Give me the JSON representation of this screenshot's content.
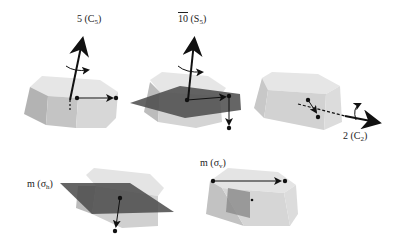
{
  "figure": {
    "panels": [
      {
        "id": "c5",
        "operation": "5",
        "symbol": "C",
        "subscript": "5",
        "type": "rotation-axis"
      },
      {
        "id": "s5",
        "operation": "10",
        "operation_overline": true,
        "symbol": "S",
        "subscript": "5",
        "type": "improper-rotation-axis"
      },
      {
        "id": "c2",
        "operation": "2",
        "symbol": "C",
        "subscript": "2",
        "type": "rotation-axis"
      },
      {
        "id": "sigma_h",
        "operation": "m",
        "symbol": "σ",
        "subscript": "h",
        "type": "mirror-plane"
      },
      {
        "id": "sigma_v",
        "operation": "m",
        "symbol": "σ",
        "subscript": "v",
        "type": "mirror-plane"
      }
    ],
    "colors": {
      "prism_light": "#e6e6e6",
      "prism_mid": "#c4c4c4",
      "prism_dark": "#a9a9a9",
      "mirror_plane": "#4a4a4a",
      "arrow": "#111111"
    }
  }
}
